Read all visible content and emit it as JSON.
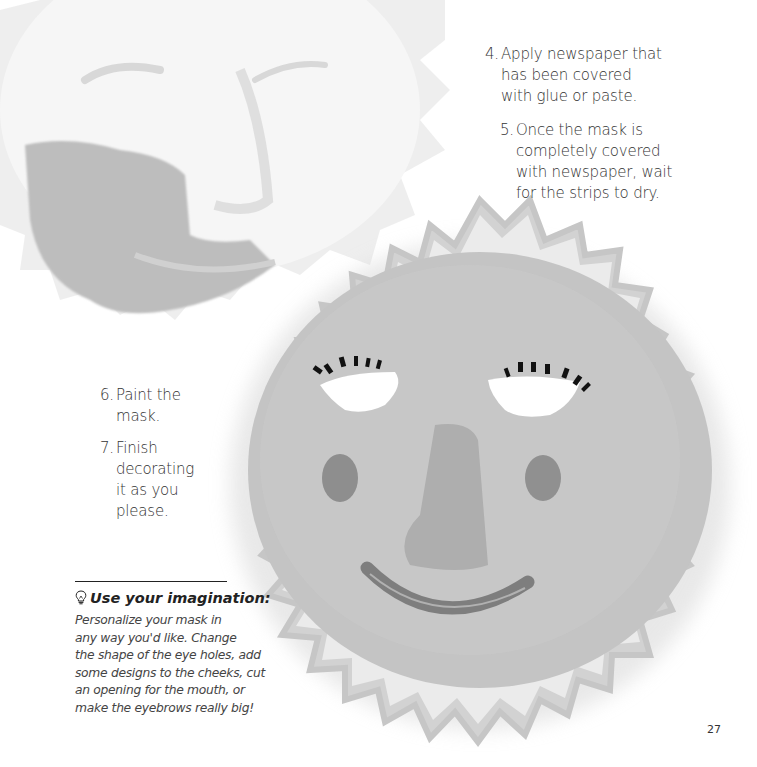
{
  "page": {
    "number": "27"
  },
  "steps": [
    {
      "num": "4.",
      "lines": [
        "Apply newspaper that",
        "has been covered",
        "with glue or paste."
      ]
    },
    {
      "num": "5.",
      "lines": [
        "Once the mask is",
        "completely covered",
        "with newspaper, wait",
        "for the strips to dry."
      ]
    },
    {
      "num": "6.",
      "lines": [
        "Paint the",
        "mask."
      ]
    },
    {
      "num": "7.",
      "lines": [
        "Finish",
        "decorating",
        "it as you",
        "please."
      ]
    }
  ],
  "tip": {
    "icon": "lightbulb-icon",
    "title": "Use your imagination:",
    "lines": [
      "Personalize your mask in",
      "any way you'd like. Change",
      "the shape of the eye holes, add",
      "some designs to the cheeks, cut",
      "an opening for the mouth, or",
      "make the eyebrows really big!"
    ]
  },
  "illustration": {
    "description": "Two papier-mâché sun masks: a white unpainted mask in progress (top-left) and a painted sun mask with eye holes, eyelashes, rosy cheeks, nose and smile (center-right)",
    "colors": {
      "painted_mask": "#c4c4c4",
      "rays": "#cfcfcf",
      "cheeks": "#8c8c8c",
      "smile": "#7e7e7e",
      "lashes": "#111111",
      "white_mask": "#f3f3f3",
      "paint_patch": "#bdbdbd"
    }
  }
}
